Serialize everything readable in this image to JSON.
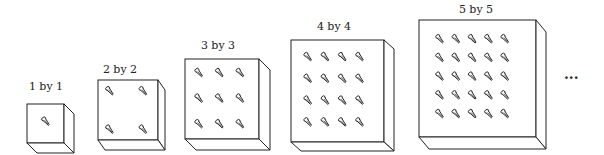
{
  "figure": {
    "boxes": [
      {
        "label": "1 by 1",
        "n": 1,
        "x": 27,
        "y": 104,
        "w": 37,
        "h": 39,
        "dx": 10,
        "dy": 10,
        "label_x": 46,
        "label_y": 80
      },
      {
        "label": "2 by 2",
        "n": 2,
        "x": 98,
        "y": 80,
        "w": 60,
        "h": 60,
        "dx": 7,
        "dy": 10,
        "label_x": 120,
        "label_y": 63
      },
      {
        "label": "3 by 3",
        "n": 3,
        "x": 185,
        "y": 59,
        "w": 74,
        "h": 80,
        "dx": 11,
        "dy": 11,
        "label_x": 218,
        "label_y": 39
      },
      {
        "label": "4 by 4",
        "n": 4,
        "x": 291,
        "y": 40,
        "w": 93,
        "h": 102,
        "dx": 10,
        "dy": 9,
        "label_x": 334,
        "label_y": 20
      },
      {
        "label": "5 by 5",
        "n": 5,
        "x": 419,
        "y": 20,
        "w": 117,
        "h": 117,
        "dx": 10,
        "dy": 12,
        "label_x": 476,
        "label_y": 3
      }
    ],
    "continuation": "...",
    "stroke_color": "#222222"
  }
}
